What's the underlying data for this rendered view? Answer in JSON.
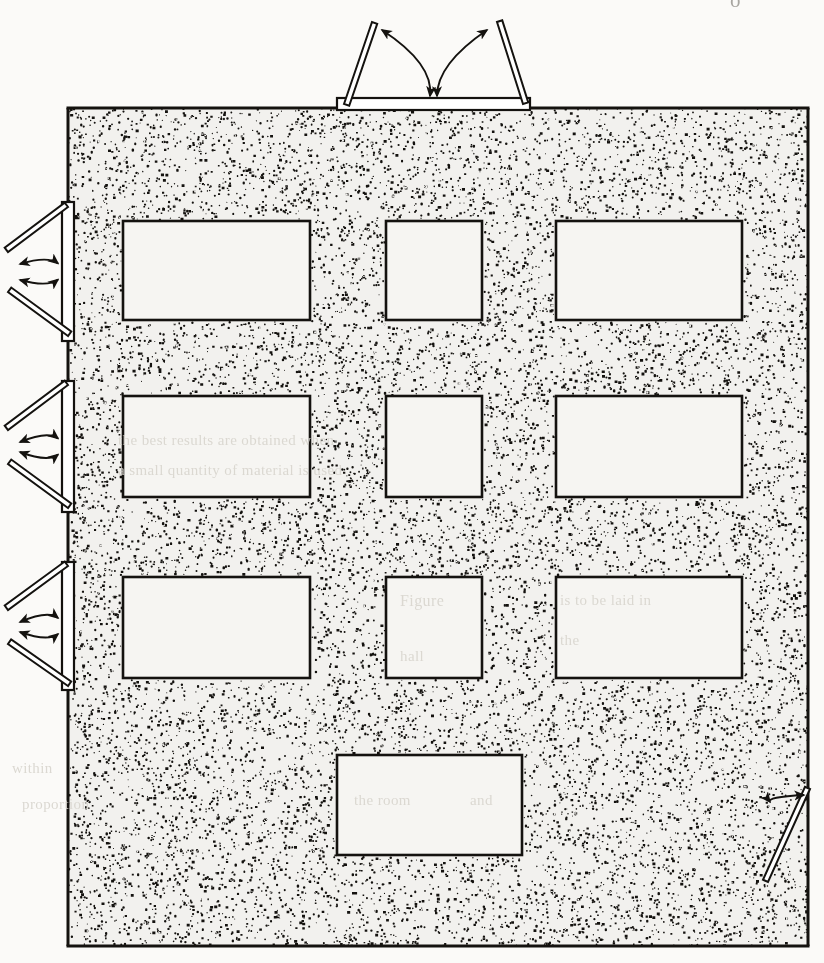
{
  "page": {
    "kind": "architectural-floor-plan",
    "width": 824,
    "height": 963,
    "paper_color": "#fbfaf8",
    "ink_color": "#14120f",
    "floor_fill_color": "#f2f1ee",
    "furniture_fill_color": "#f6f5f2",
    "corner_mark": "o"
  },
  "room": {
    "name": "main-room",
    "x": 68,
    "y": 108,
    "width": 740,
    "height": 838,
    "wall_thickness": 3,
    "floor_hatch": "stipple",
    "stipple_seed": 20250614,
    "stipple_count": 17500,
    "stipple_dot_min": 1.0,
    "stipple_dot_max": 2.5
  },
  "furniture": {
    "label": "tables",
    "items": [
      {
        "name": "table-r1-c1",
        "x": 123,
        "y": 221,
        "width": 187,
        "height": 99
      },
      {
        "name": "table-r1-c2",
        "x": 386,
        "y": 221,
        "width": 96,
        "height": 99
      },
      {
        "name": "table-r1-c3",
        "x": 556,
        "y": 221,
        "width": 186,
        "height": 99
      },
      {
        "name": "table-r2-c1",
        "x": 123,
        "y": 396,
        "width": 187,
        "height": 101
      },
      {
        "name": "table-r2-c2",
        "x": 386,
        "y": 396,
        "width": 96,
        "height": 101
      },
      {
        "name": "table-r2-c3",
        "x": 556,
        "y": 396,
        "width": 186,
        "height": 101
      },
      {
        "name": "table-r3-c1",
        "x": 123,
        "y": 577,
        "width": 187,
        "height": 101
      },
      {
        "name": "table-r3-c2",
        "x": 386,
        "y": 577,
        "width": 96,
        "height": 101
      },
      {
        "name": "table-r3-c3",
        "x": 556,
        "y": 577,
        "width": 186,
        "height": 101
      },
      {
        "name": "table-bottom-center",
        "x": 337,
        "y": 755,
        "width": 185,
        "height": 100
      }
    ]
  },
  "doors": {
    "label": "doors",
    "top_double": {
      "name": "door-top-double",
      "opening": {
        "x": 337,
        "y": 98,
        "width": 193,
        "height": 12
      },
      "leaves": [
        {
          "name": "door-leaf-top-left",
          "hinge_x": 344,
          "hinge_y": 104,
          "tip_x": 372,
          "tip_y": 22
        },
        {
          "name": "door-leaf-top-right",
          "hinge_x": 523,
          "hinge_y": 104,
          "tip_x": 497,
          "tip_y": 22
        }
      ],
      "swing_arrows": 2,
      "swing": "outward"
    },
    "left_doubles": [
      {
        "name": "door-left-double-1",
        "opening": {
          "x": 62,
          "y": 202,
          "width": 12,
          "height": 139
        },
        "leaves": [
          {
            "name": "door-leaf-l1-upper",
            "hinge_x": 68,
            "hinge_y": 207,
            "tip_x": 8,
            "tip_y": 252
          },
          {
            "name": "door-leaf-l1-lower",
            "hinge_x": 68,
            "hinge_y": 336,
            "tip_x": 8,
            "tip_y": 292
          }
        ],
        "swing": "outward"
      },
      {
        "name": "door-left-double-2",
        "opening": {
          "x": 62,
          "y": 381,
          "width": 12,
          "height": 131
        },
        "leaves": [
          {
            "name": "door-leaf-l2-upper",
            "hinge_x": 68,
            "hinge_y": 385,
            "tip_x": 8,
            "tip_y": 430
          },
          {
            "name": "door-leaf-l2-lower",
            "hinge_x": 68,
            "hinge_y": 508,
            "tip_x": 8,
            "tip_y": 464
          }
        ],
        "swing": "outward"
      },
      {
        "name": "door-left-double-3",
        "opening": {
          "x": 62,
          "y": 562,
          "width": 12,
          "height": 128
        },
        "leaves": [
          {
            "name": "door-leaf-l3-upper",
            "hinge_x": 68,
            "hinge_y": 566,
            "tip_x": 8,
            "tip_y": 610
          },
          {
            "name": "door-leaf-l3-lower",
            "hinge_x": 68,
            "hinge_y": 686,
            "tip_x": 8,
            "tip_y": 644
          }
        ],
        "swing": "outward"
      }
    ],
    "bottom_right_single": {
      "name": "door-bottom-right-single",
      "hinge_x": 810,
      "hinge_y": 789,
      "tip_x": 768,
      "tip_y": 882,
      "swing": "inward",
      "swing_arrows": 1
    }
  },
  "bleed_through_text": {
    "note": "faint show-through from the reverse side of the scanned page",
    "lines": [
      {
        "name": "bleed-line-1",
        "text": "the best results are obtained when",
        "x": 118,
        "y": 432,
        "size": 15
      },
      {
        "name": "bleed-line-2",
        "text": "a small quantity of material is used",
        "x": 118,
        "y": 462,
        "size": 15
      },
      {
        "name": "bleed-line-3",
        "text": "Figure",
        "x": 400,
        "y": 592,
        "size": 16
      },
      {
        "name": "bleed-line-4",
        "text": "hall",
        "x": 400,
        "y": 648,
        "size": 15
      },
      {
        "name": "bleed-line-5",
        "text": "is to be laid in",
        "x": 560,
        "y": 592,
        "size": 15
      },
      {
        "name": "bleed-line-6",
        "text": "the",
        "x": 560,
        "y": 632,
        "size": 15
      },
      {
        "name": "bleed-line-7",
        "text": "within",
        "x": 12,
        "y": 760,
        "size": 15
      },
      {
        "name": "bleed-line-8",
        "text": "proportion",
        "x": 22,
        "y": 796,
        "size": 15
      },
      {
        "name": "bleed-line-9",
        "text": "the room",
        "x": 354,
        "y": 792,
        "size": 15
      },
      {
        "name": "bleed-line-10",
        "text": "and",
        "x": 470,
        "y": 792,
        "size": 15
      }
    ]
  }
}
